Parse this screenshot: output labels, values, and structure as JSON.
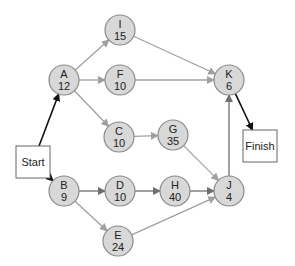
{
  "caption": "(partially cropped title text)",
  "colors": {
    "node_fill": "#d8d8d8",
    "node_stroke": "#8a8a8a",
    "edge_light": "#a0a0a0",
    "edge_mid": "#7a7a7a",
    "edge_dark": "#111111",
    "box_stroke": "#666666",
    "box_fill": "#ffffff"
  },
  "diagram": {
    "type": "activity-on-node network",
    "terminals": [
      {
        "id": "start",
        "label": "Start",
        "x": 16,
        "y": 146,
        "w": 34,
        "h": 32
      },
      {
        "id": "finish",
        "label": "Finish",
        "x": 243,
        "y": 130,
        "w": 34,
        "h": 32
      }
    ],
    "nodes": [
      {
        "id": "A",
        "label": "A",
        "duration": "12",
        "cx": 64,
        "cy": 80
      },
      {
        "id": "B",
        "label": "B",
        "duration": "9",
        "cx": 64,
        "cy": 191
      },
      {
        "id": "C",
        "label": "C",
        "duration": "10",
        "cx": 119,
        "cy": 137
      },
      {
        "id": "D",
        "label": "D",
        "duration": "10",
        "cx": 120,
        "cy": 191
      },
      {
        "id": "E",
        "label": "E",
        "duration": "24",
        "cx": 118,
        "cy": 241
      },
      {
        "id": "F",
        "label": "F",
        "duration": "10",
        "cx": 120,
        "cy": 80
      },
      {
        "id": "G",
        "label": "G",
        "duration": "35",
        "cx": 173,
        "cy": 135
      },
      {
        "id": "H",
        "label": "H",
        "duration": "40",
        "cx": 175,
        "cy": 191
      },
      {
        "id": "I",
        "label": "I",
        "duration": "15",
        "cx": 120,
        "cy": 30
      },
      {
        "id": "J",
        "label": "J",
        "duration": "4",
        "cx": 229,
        "cy": 191
      },
      {
        "id": "K",
        "label": "K",
        "duration": "6",
        "cx": 229,
        "cy": 80
      }
    ],
    "edges": [
      {
        "from": "start",
        "to": "A",
        "style": "dark"
      },
      {
        "from": "start",
        "to": "B",
        "style": "dark"
      },
      {
        "from": "A",
        "to": "I",
        "style": "light"
      },
      {
        "from": "A",
        "to": "F",
        "style": "light"
      },
      {
        "from": "A",
        "to": "C",
        "style": "light"
      },
      {
        "from": "I",
        "to": "K",
        "style": "light"
      },
      {
        "from": "F",
        "to": "K",
        "style": "light"
      },
      {
        "from": "C",
        "to": "G",
        "style": "light"
      },
      {
        "from": "G",
        "to": "J",
        "style": "light"
      },
      {
        "from": "B",
        "to": "D",
        "style": "mid"
      },
      {
        "from": "B",
        "to": "E",
        "style": "light"
      },
      {
        "from": "D",
        "to": "H",
        "style": "mid"
      },
      {
        "from": "H",
        "to": "J",
        "style": "mid"
      },
      {
        "from": "E",
        "to": "J",
        "style": "light"
      },
      {
        "from": "J",
        "to": "K",
        "style": "mid"
      },
      {
        "from": "K",
        "to": "finish",
        "style": "dark"
      }
    ]
  }
}
